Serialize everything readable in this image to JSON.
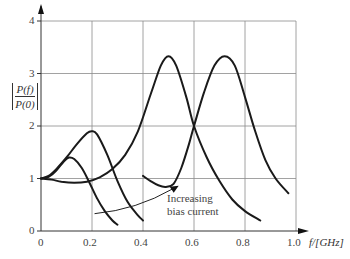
{
  "chart_data": {
    "type": "line",
    "title": "",
    "xlabel": "f/[GHz]",
    "ylabel": "|P(f)/P(0)|",
    "ylabel_num": "P(f)",
    "ylabel_den": "P(0)",
    "xlim": [
      0,
      1.0
    ],
    "ylim": [
      0,
      4
    ],
    "grid": true,
    "legend": "none",
    "x_ticks": [
      "0",
      "0.2",
      "0.4",
      "0.6",
      "0.8",
      "1.0"
    ],
    "y_ticks": [
      "0",
      "1",
      "2",
      "3",
      "4"
    ],
    "annotation": {
      "line1": "Increasing",
      "line2": "bias current",
      "arrow_from": [
        0.21,
        0.33
      ],
      "arrow_to": [
        0.54,
        0.86
      ]
    },
    "series": [
      {
        "name": "bias 1 (lowest)",
        "x": [
          0.0,
          0.03,
          0.06,
          0.09,
          0.11,
          0.13,
          0.16,
          0.19,
          0.22,
          0.25,
          0.28,
          0.3
        ],
        "y": [
          1.0,
          1.03,
          1.15,
          1.33,
          1.4,
          1.37,
          1.2,
          0.92,
          0.62,
          0.38,
          0.2,
          0.12
        ]
      },
      {
        "name": "bias 2",
        "x": [
          0.0,
          0.03,
          0.06,
          0.1,
          0.14,
          0.18,
          0.2,
          0.22,
          0.26,
          0.3,
          0.34,
          0.38,
          0.4
        ],
        "y": [
          1.0,
          1.05,
          1.18,
          1.4,
          1.65,
          1.86,
          1.9,
          1.84,
          1.45,
          0.95,
          0.55,
          0.3,
          0.2
        ]
      },
      {
        "name": "bias 3",
        "x": [
          0.0,
          0.04,
          0.08,
          0.13,
          0.18,
          0.23,
          0.28,
          0.33,
          0.38,
          0.43,
          0.47,
          0.5,
          0.53,
          0.57,
          0.6,
          0.65,
          0.7,
          0.75,
          0.8,
          0.86
        ],
        "y": [
          1.0,
          0.98,
          0.94,
          0.92,
          0.94,
          1.02,
          1.18,
          1.45,
          1.9,
          2.6,
          3.15,
          3.33,
          3.15,
          2.55,
          2.0,
          1.4,
          0.95,
          0.6,
          0.38,
          0.2
        ]
      },
      {
        "name": "bias 4 (highest)",
        "x": [
          0.4,
          0.43,
          0.46,
          0.49,
          0.52,
          0.55,
          0.58,
          0.6,
          0.64,
          0.68,
          0.72,
          0.76,
          0.8,
          0.84,
          0.88,
          0.92,
          0.97
        ],
        "y": [
          1.05,
          0.95,
          0.87,
          0.84,
          0.9,
          1.2,
          1.65,
          2.0,
          2.65,
          3.15,
          3.33,
          3.15,
          2.55,
          1.9,
          1.35,
          1.0,
          0.72
        ]
      }
    ]
  },
  "colors": {
    "curve": "#1a1a1a",
    "grid": "#8a8a8a",
    "axis": "#333333",
    "text": "#444444"
  }
}
